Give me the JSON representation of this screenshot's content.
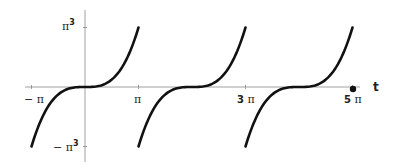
{
  "chart_data": {
    "type": "line",
    "title": "",
    "xlabel": "t",
    "ylabel": "",
    "x_ticks": [
      "-π",
      "π",
      "3 π",
      "5 π"
    ],
    "y_ticks": [
      "π³",
      "-π³"
    ],
    "xlim": [
      -3.1416,
      15.708
    ],
    "ylim": [
      -31.006,
      31.006
    ],
    "grid": false,
    "legend": null,
    "series": [
      {
        "name": "f(t) = t^3 (2π-periodic)",
        "segments": [
          {
            "x_start": -3.1416,
            "x_end": 3.1416
          },
          {
            "x_start": 3.1416,
            "x_end": 9.4248
          },
          {
            "x_start": 9.4248,
            "x_end": 15.708
          }
        ]
      }
    ],
    "annotations": [
      {
        "type": "point",
        "x": 15.708,
        "y": 0,
        "label": "filled dot at 5π on axis"
      }
    ]
  },
  "labels": {
    "x_neg_pi": "− π",
    "x_pi": "π",
    "x_3pi_num": "3",
    "x_3pi_sym": "π",
    "x_5pi_num": "5",
    "x_5pi_sym": "π",
    "x_axis": "t",
    "y_top_sym": "π",
    "y_top_exp": "3",
    "y_bot_sym": "− π",
    "y_bot_exp": "3"
  }
}
